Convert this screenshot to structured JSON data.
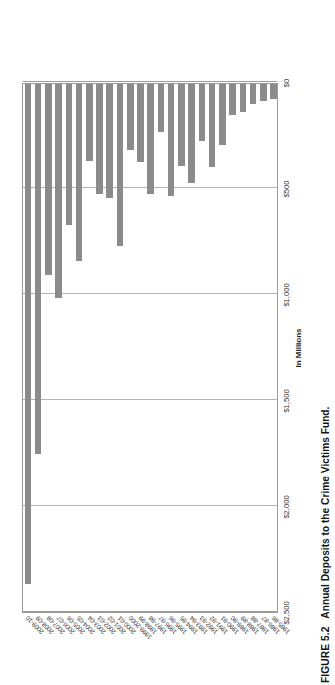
{
  "caption": {
    "figure_number": "FIGURE 5.2",
    "text": "Annual Deposits to the Crime Victims Fund."
  },
  "chart_data": {
    "type": "bar",
    "orientation": "horizontal",
    "title": "",
    "xlabel": "In Millions",
    "ylabel": "",
    "xlim": [
      0,
      2500
    ],
    "tick_labels": [
      "$0",
      "$500",
      "$1,000",
      "$1,500",
      "$2,000",
      "$2,500"
    ],
    "ticks": [
      0,
      500,
      1000,
      1500,
      2000,
      2500
    ],
    "grid": true,
    "legend": "none",
    "bar_color": "#8b8b8b",
    "categories": [
      "2009-10",
      "2008-09",
      "2007-08",
      "2006-07",
      "2005-06",
      "2004-05",
      "2003-04",
      "2002-03",
      "2001-02",
      "2000-01",
      "1999-2000",
      "1998-99",
      "1997-98",
      "1996-97",
      "1995-96",
      "1994-95",
      "1993-94",
      "1992-93",
      "1991-92",
      "1990-91",
      "1989-90",
      "1988-89",
      "1987-88",
      "1986-87",
      "1985-86"
    ],
    "values": [
      2360,
      1745,
      900,
      1010,
      665,
      835,
      365,
      520,
      540,
      765,
      310,
      370,
      520,
      225,
      530,
      385,
      465,
      270,
      390,
      290,
      145,
      130,
      95,
      80,
      70
    ]
  }
}
